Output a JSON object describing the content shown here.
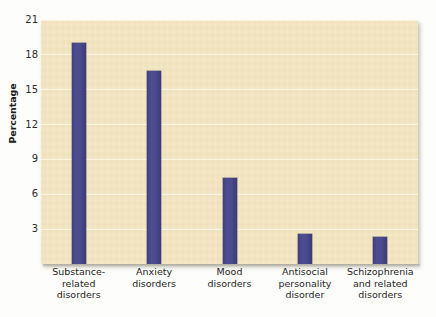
{
  "chart_data": {
    "type": "bar",
    "title": "",
    "subtitle": "",
    "xlabel": "",
    "ylabel": "Percentage",
    "ylim": [
      0,
      21
    ],
    "yticks": [
      3,
      6,
      9,
      12,
      15,
      18,
      21
    ],
    "ytick_labels": [
      "3",
      "6",
      "9",
      "12",
      "15",
      "18",
      "21"
    ],
    "grid": true,
    "legend": false,
    "legend_position": "none",
    "categories": [
      "Substance-\nrelated\ndisorders",
      "Anxiety\ndisorders",
      "Mood\ndisorders",
      "Antisocial\npersonality\ndisorder",
      "Schizophrenia\nand related\ndisorders"
    ],
    "category_plain": [
      "Substance-related disorders",
      "Anxiety disorders",
      "Mood disorders",
      "Antisocial personality disorder",
      "Schizophrenia and related disorders"
    ],
    "values": [
      19.0,
      16.6,
      7.4,
      2.6,
      2.3
    ],
    "series": [
      {
        "name": "Percentage",
        "values": [
          19.0,
          16.6,
          7.4,
          2.6,
          2.3
        ]
      }
    ],
    "colors": {
      "bar": "#4a4a8c",
      "plot_background": "#f1e4bf",
      "gridline": "#fbf6e6",
      "text": "#1f1f1f",
      "page_background": "#ffffff"
    }
  },
  "axis": {
    "y_title": "Percentage"
  }
}
